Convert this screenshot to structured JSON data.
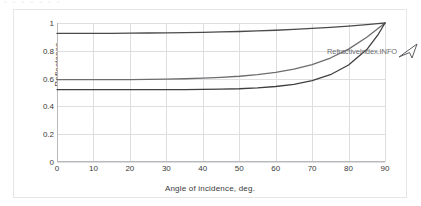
{
  "figure": {
    "watermark_text": "RefractiveIndex.INFO",
    "logo_icon": "arrow-triangle-icon"
  },
  "chart_data": {
    "type": "line",
    "title": "",
    "xlabel": "Angle of incidence, deg.",
    "ylabel": "Reflectance",
    "xlim": [
      0,
      90
    ],
    "ylim": [
      0,
      1
    ],
    "xticks": [
      0,
      10,
      20,
      30,
      40,
      50,
      60,
      70,
      80,
      90
    ],
    "yticks": [
      0,
      0.2,
      0.4,
      0.6,
      0.8,
      1
    ],
    "xtick_labels": [
      "0",
      "10",
      "20",
      "30",
      "40",
      "50",
      "60",
      "70",
      "80",
      "90"
    ],
    "ytick_labels": [
      "0",
      "0.2",
      "0.4",
      "0.6",
      "0.8",
      "1"
    ],
    "grid": true,
    "legend": false,
    "legend_position": "none",
    "x": [
      0,
      5,
      10,
      15,
      20,
      25,
      30,
      35,
      40,
      45,
      50,
      55,
      60,
      65,
      70,
      75,
      80,
      85,
      88,
      90
    ],
    "series": [
      {
        "name": "Rs",
        "color": "#4a4a4a",
        "values": [
          0.925,
          0.925,
          0.926,
          0.926,
          0.927,
          0.928,
          0.929,
          0.931,
          0.933,
          0.936,
          0.939,
          0.943,
          0.948,
          0.954,
          0.961,
          0.969,
          0.978,
          0.988,
          0.995,
          1.0
        ]
      },
      {
        "name": "Rp-upper",
        "color": "#6d6d70",
        "values": [
          0.592,
          0.592,
          0.592,
          0.592,
          0.593,
          0.594,
          0.596,
          0.599,
          0.603,
          0.609,
          0.617,
          0.628,
          0.645,
          0.668,
          0.701,
          0.748,
          0.812,
          0.897,
          0.958,
          1.0
        ]
      },
      {
        "name": "Rp-lower",
        "color": "#3f3f3f",
        "values": [
          0.521,
          0.521,
          0.521,
          0.521,
          0.521,
          0.521,
          0.521,
          0.521,
          0.522,
          0.524,
          0.527,
          0.533,
          0.543,
          0.559,
          0.585,
          0.628,
          0.698,
          0.809,
          0.912,
          1.0
        ]
      }
    ]
  }
}
